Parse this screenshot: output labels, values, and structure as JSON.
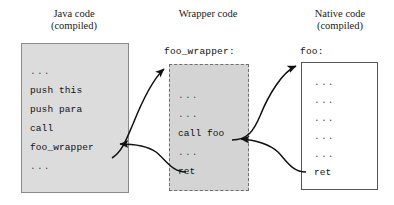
{
  "diagram": {
    "background_color": "#ffffff",
    "columns": [
      {
        "id": "java",
        "title": "Java code\n(compiled)",
        "box_fill": "#dcdcdc",
        "box_border": "#8a8a8a",
        "border_style": "solid",
        "label": "",
        "lines": [
          "...",
          "push this",
          "push para",
          "call",
          "foo_wrapper",
          "..."
        ]
      },
      {
        "id": "wrapper",
        "title": "Wrapper code",
        "box_fill": "#d4d4d4",
        "box_border": "#6e6e6e",
        "border_style": "dashed",
        "label": "foo_wrapper:",
        "lines": [
          "...",
          "...",
          "call foo",
          "...",
          "ret"
        ]
      },
      {
        "id": "native",
        "title": "Native code\n(compiled)",
        "box_fill": "#ffffff",
        "box_border": "#555555",
        "border_style": "solid",
        "label": "foo:",
        "lines": [
          "...",
          "...",
          "...",
          "...",
          "...",
          "ret"
        ]
      }
    ],
    "arrows": [
      {
        "id": "java-to-wrapper",
        "name": "call-arrow-java-to-wrapper",
        "from": "Java code: call foo_wrapper",
        "to": "Wrapper code: entry foo_wrapper:",
        "color": "#111111"
      },
      {
        "id": "wrapper-to-java",
        "name": "return-arrow-wrapper-to-java",
        "from": "Wrapper code: ret",
        "to": "Java code: foo_wrapper",
        "color": "#111111"
      },
      {
        "id": "wrapper-to-native",
        "name": "call-arrow-wrapper-to-native",
        "from": "Wrapper code: call foo",
        "to": "Native code: entry foo:",
        "color": "#111111"
      },
      {
        "id": "native-to-wrapper",
        "name": "return-arrow-native-to-wrapper",
        "from": "Native code: ret",
        "to": "Wrapper code: after call foo",
        "color": "#111111"
      }
    ]
  }
}
